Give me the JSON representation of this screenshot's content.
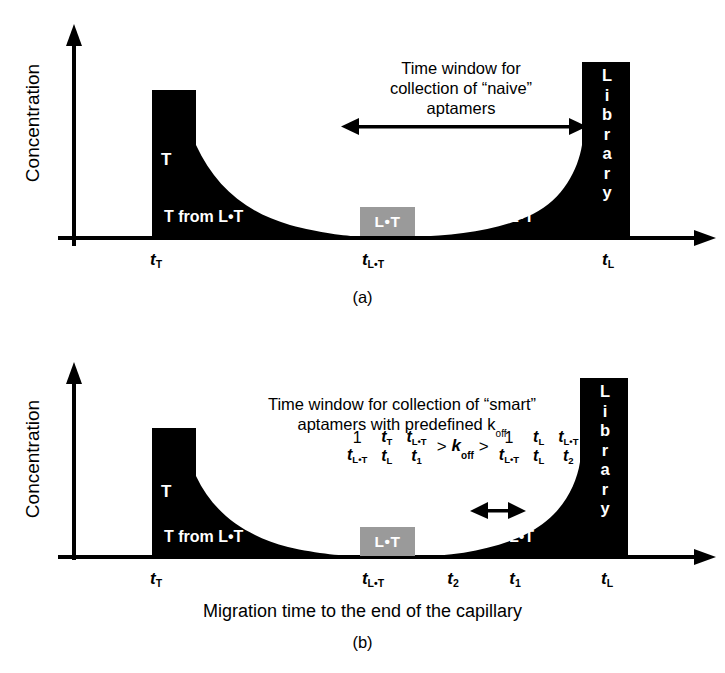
{
  "figure": {
    "axis_y_label": "Concentration",
    "axis_x_label": "Migration time to the end of the capillary"
  },
  "panel_a": {
    "letter": "(a)",
    "caption": "Time window for\ncollection of “naive”\naptamers",
    "peak_label": "T",
    "left_tail_label": "T from L•T",
    "complex_label": "L•T",
    "right_tail_label": "L from L•T",
    "library_label": "Library",
    "ticks": [
      {
        "base": "t",
        "sub": "T"
      },
      {
        "base": "t",
        "sub": "L•T"
      },
      {
        "base": "t",
        "sub": "L"
      }
    ]
  },
  "panel_b": {
    "letter": "(b)",
    "caption": "Time window for collection of “smart”\naptamers with predefined k",
    "caption_sub": "off",
    "peak_label": "T",
    "left_tail_label": "T from L•T",
    "complex_label": "L•T",
    "right_tail_label": "L from L•T",
    "library_label": "Library",
    "ticks": [
      {
        "base": "t",
        "sub": "T"
      },
      {
        "base": "t",
        "sub": "L•T"
      },
      {
        "base": "t",
        "sub": "2"
      },
      {
        "base": "t",
        "sub": "1"
      },
      {
        "base": "t",
        "sub": "L"
      }
    ],
    "formula": {
      "left_fractions": [
        {
          "num": "1",
          "num_sub": "",
          "den": "t",
          "den_sub": "L•T",
          "num_plain": true
        },
        {
          "num": "t",
          "num_sub": "T",
          "den": "t",
          "den_sub": "L",
          "num_plain": false
        },
        {
          "num": "t",
          "num_sub": "L•T",
          "den": "t",
          "den_sub": "1",
          "num_plain": false
        }
      ],
      "operator_left": ">",
      "center": "k",
      "center_sub": "off",
      "operator_right": ">",
      "right_fractions": [
        {
          "num": "1",
          "num_sub": "",
          "den": "t",
          "den_sub": "L•T",
          "num_plain": true
        },
        {
          "num": "t",
          "num_sub": "L",
          "den": "t",
          "den_sub": "L",
          "num_plain": false
        },
        {
          "num": "t",
          "num_sub": "L•T",
          "den": "t",
          "den_sub": "2",
          "num_plain": false
        }
      ]
    }
  },
  "colors": {
    "ink": "#000000",
    "complex_box": "#9a9a9a",
    "background": "#ffffff"
  }
}
